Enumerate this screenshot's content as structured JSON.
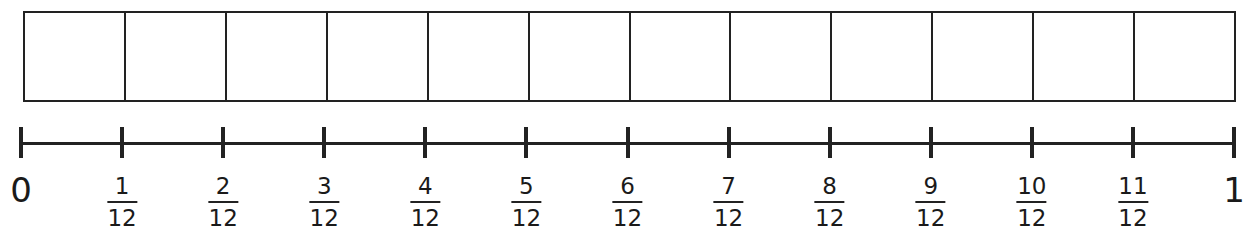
{
  "diagram": {
    "title": "",
    "type": "fraction bar model with number line",
    "bar_model": {
      "parts": 12,
      "shaded_parts": 0
    },
    "number_line": {
      "start_label": "0",
      "end_label": "1",
      "denominator": "12",
      "tick_labels": [
        {
          "whole": "0"
        },
        {
          "num": "1",
          "den": "12"
        },
        {
          "num": "2",
          "den": "12"
        },
        {
          "num": "3",
          "den": "12"
        },
        {
          "num": "4",
          "den": "12"
        },
        {
          "num": "5",
          "den": "12"
        },
        {
          "num": "6",
          "den": "12"
        },
        {
          "num": "7",
          "den": "12"
        },
        {
          "num": "8",
          "den": "12"
        },
        {
          "num": "9",
          "den": "12"
        },
        {
          "num": "10",
          "den": "12"
        },
        {
          "num": "11",
          "den": "12"
        },
        {
          "whole": "1"
        }
      ]
    },
    "colors": {
      "line": "#222222",
      "background": "#ffffff",
      "text": "#1a1a1a"
    }
  }
}
